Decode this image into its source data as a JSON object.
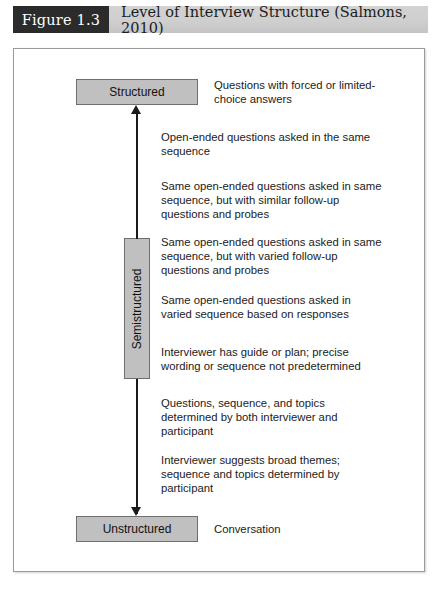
{
  "header": {
    "figure_number": "Figure 1.3",
    "title": "Level of Interview Structure (Salmons, 2010)"
  },
  "diagram": {
    "boxes": {
      "top": "Structured",
      "middle": "Semistructured",
      "bottom": "Unstructured"
    },
    "annotations": {
      "structured": "Questions with forced or limited-choice answers",
      "unstructured": "Conversation",
      "items": [
        "Open-ended questions asked in the same sequence",
        "Same open-ended questions asked in same sequence, but with similar follow-up questions and probes",
        "Same open-ended questions asked in same sequence, but with varied follow-up questions and probes",
        "Same open-ended questions asked in varied sequence based on responses",
        "Interviewer has guide or plan; precise wording or sequence not predetermined",
        "Questions, sequence, and topics determined by both interviewer and participant",
        "Interviewer suggests broad themes; sequence and topics determined by participant"
      ]
    },
    "colors": {
      "box_fill": "#c0c0c0",
      "box_border": "#6e6e6e",
      "chip_background": "#2b2b2b",
      "header_background": "#cfcfcf",
      "arrow": "#1a1a1a",
      "frame_border": "#9a9a9a"
    }
  }
}
